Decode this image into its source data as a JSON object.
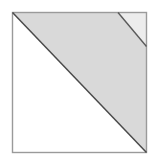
{
  "figure": {
    "name": "shaded-square-diagonals",
    "canvas": {
      "width": 158,
      "height": 161,
      "background": "#ffffff"
    },
    "square": {
      "left": 12.5,
      "top": 12.5,
      "right": 146.5,
      "bottom": 152.5,
      "border_color": "#9a9a9a",
      "border_width": 1.4
    },
    "regions": [
      {
        "name": "lower-left-white-triangle",
        "fill": "#ffffff",
        "points": "12.5,12.5 12.5,152.5 146.5,152.5"
      },
      {
        "name": "upper-right-gray-band",
        "fill": "#d9d9d9",
        "points": "12.5,12.5 118,12.5 146.5,46.5 146.5,152.5"
      },
      {
        "name": "top-right-light-triangle",
        "fill": "#ececec",
        "points": "118,12.5 146.5,12.5 146.5,46.5"
      }
    ],
    "lines": [
      {
        "name": "main-diagonal",
        "x1": 12.5,
        "y1": 12.5,
        "x2": 146.5,
        "y2": 152.5,
        "stroke": "#4a4a4a",
        "width": 1.5
      },
      {
        "name": "secondary-diagonal",
        "x1": 118,
        "y1": 12.5,
        "x2": 146.5,
        "y2": 46.5,
        "stroke": "#5a5a5a",
        "width": 1.4
      }
    ],
    "colors": {
      "background": "#ffffff",
      "band_gray": "#d9d9d9",
      "corner_light_gray": "#ececec",
      "outline_gray": "#9a9a9a",
      "diagonal_dark": "#4a4a4a"
    }
  }
}
